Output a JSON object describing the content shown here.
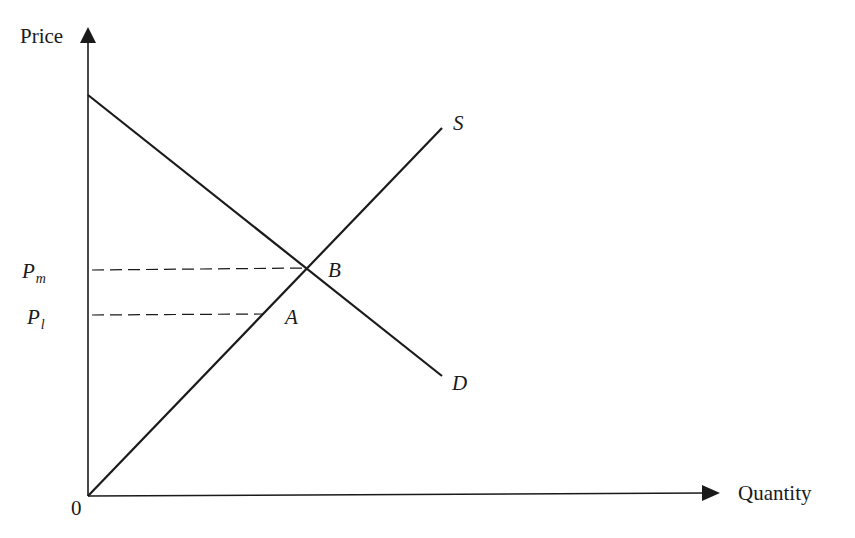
{
  "diagram": {
    "type": "supply-demand",
    "axes": {
      "y_label": "Price",
      "x_label": "Quantity",
      "origin_label": "0"
    },
    "curves": [
      {
        "name": "S",
        "label": "S",
        "description": "supply curve, upward sloping from origin"
      },
      {
        "name": "D",
        "label": "D",
        "description": "demand curve, downward sloping"
      }
    ],
    "points": [
      {
        "name": "B",
        "label": "B",
        "description": "intersection of S and D"
      },
      {
        "name": "A",
        "label": "A",
        "description": "point on S at price Pl"
      }
    ],
    "price_levels": [
      {
        "main": "P",
        "sub": "m",
        "description": "price at B"
      },
      {
        "main": "P",
        "sub": "l",
        "description": "price at A"
      }
    ],
    "colors": {
      "line": "#1a1a1a",
      "background": "#ffffff"
    }
  }
}
